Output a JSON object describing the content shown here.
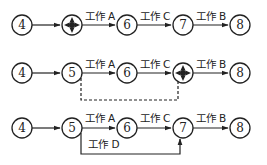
{
  "diagram": {
    "type": "network-diagram",
    "rows": [
      {
        "id": "row1",
        "nodes": [
          {
            "id": "4",
            "label": "4",
            "x": 22,
            "merged": false
          },
          {
            "id": "5",
            "label": "",
            "x": 72,
            "merged": true
          },
          {
            "id": "6",
            "label": "6",
            "x": 127,
            "merged": false
          },
          {
            "id": "7",
            "label": "7",
            "x": 183,
            "merged": false
          },
          {
            "id": "8",
            "label": "8",
            "x": 240,
            "merged": false
          }
        ],
        "edges": [
          {
            "from": "4",
            "to": "5",
            "label": ""
          },
          {
            "from": "5",
            "to": "6",
            "label": "工作 A"
          },
          {
            "from": "6",
            "to": "7",
            "label": "工作 C"
          },
          {
            "from": "7",
            "to": "8",
            "label": "工作 B"
          }
        ]
      },
      {
        "id": "row2",
        "nodes": [
          {
            "id": "4",
            "label": "4",
            "x": 22,
            "merged": false
          },
          {
            "id": "5",
            "label": "5",
            "x": 72,
            "merged": false
          },
          {
            "id": "6",
            "label": "6",
            "x": 127,
            "merged": false
          },
          {
            "id": "7",
            "label": "",
            "x": 183,
            "merged": true
          },
          {
            "id": "8",
            "label": "8",
            "x": 240,
            "merged": false
          }
        ],
        "edges": [
          {
            "from": "4",
            "to": "5",
            "label": ""
          },
          {
            "from": "5",
            "to": "6",
            "label": "工作 A"
          },
          {
            "from": "6",
            "to": "7",
            "label": "工作 C"
          },
          {
            "from": "7",
            "to": "8",
            "label": "工作 B"
          },
          {
            "from": "5",
            "to": "7",
            "label": "",
            "style": "dashed",
            "route": "below"
          }
        ]
      },
      {
        "id": "row3",
        "nodes": [
          {
            "id": "4",
            "label": "4",
            "x": 22,
            "merged": false
          },
          {
            "id": "5",
            "label": "5",
            "x": 72,
            "merged": false
          },
          {
            "id": "6",
            "label": "6",
            "x": 127,
            "merged": false
          },
          {
            "id": "7",
            "label": "7",
            "x": 183,
            "merged": false
          },
          {
            "id": "8",
            "label": "8",
            "x": 240,
            "merged": false
          }
        ],
        "edges": [
          {
            "from": "4",
            "to": "5",
            "label": ""
          },
          {
            "from": "5",
            "to": "6",
            "label": "工作 A"
          },
          {
            "from": "6",
            "to": "7",
            "label": "工作 C"
          },
          {
            "from": "7",
            "to": "8",
            "label": "工作 B"
          },
          {
            "from": "5",
            "to": "7",
            "label": "工作 D",
            "style": "solid",
            "route": "below"
          }
        ]
      }
    ],
    "labels": {
      "r1": {
        "n4": "4",
        "n6": "6",
        "n7": "7",
        "n8": "8",
        "a": "工作 A",
        "c": "工作 C",
        "b": "工作 B"
      },
      "r2": {
        "n4": "4",
        "n5": "5",
        "n6": "6",
        "n8": "8",
        "a": "工作 A",
        "c": "工作 C",
        "b": "工作 B"
      },
      "r3": {
        "n4": "4",
        "n5": "5",
        "n6": "6",
        "n7": "7",
        "n8": "8",
        "a": "工作 A",
        "c": "工作 C",
        "b": "工作 B",
        "d": "工作 D"
      }
    }
  }
}
